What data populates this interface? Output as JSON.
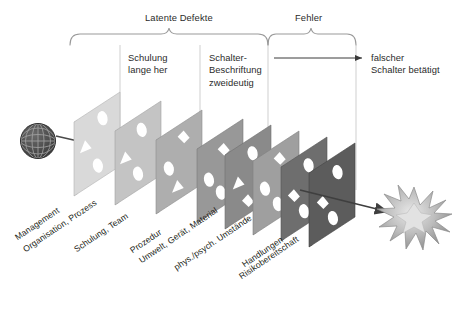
{
  "diagram": {
    "type": "swiss-cheese-model",
    "background_color": "#ffffff",
    "brackets": [
      {
        "label": "Latente Defekte",
        "x_start": 70,
        "x_end": 268,
        "label_x": 145,
        "label_y": 12
      },
      {
        "label": "Fehler",
        "x_start": 268,
        "x_end": 356,
        "label_x": 295,
        "label_y": 12
      }
    ],
    "column_notes": [
      {
        "lines": [
          "Schulung",
          "lange her"
        ],
        "x": 128,
        "y": 52
      },
      {
        "lines": [
          "Schalter-",
          "Beschriftung",
          "zweideutig"
        ],
        "x": 209,
        "y": 52
      },
      {
        "lines": [
          "falscher",
          "Schalter betätigt"
        ],
        "x": 371,
        "y": 52
      }
    ],
    "divider_lines_x": [
      120,
      200,
      268,
      356
    ],
    "hazard_icon": {
      "name": "globe-icon",
      "cx": 38,
      "cy": 141,
      "r": 18
    },
    "outcome_icon": {
      "name": "accident-star-icon",
      "cx": 414,
      "cy": 219,
      "r": 30
    },
    "trajectory_arrow": {
      "from_x": 56,
      "from_y": 136,
      "to_x": 388,
      "to_y": 212
    },
    "straight_arrow": {
      "from_x": 275,
      "from_y": 58,
      "to_x": 363,
      "to_y": 58
    },
    "slices": [
      {
        "label": "Management",
        "fill": "#d9d9d9",
        "edge": "#b4b4b4",
        "x": 74,
        "y": 122
      },
      {
        "label": "Organisation, Prozess",
        "fill": "#c4c4c4",
        "edge": "#a2a2a2",
        "x": 115,
        "y": 131
      },
      {
        "label": "Schulung, Team",
        "fill": "#aeaeae",
        "edge": "#8e8e8e",
        "x": 156,
        "y": 140
      },
      {
        "label": "Prozedur",
        "fill": "#989898",
        "edge": "#7b7b7b",
        "x": 197,
        "y": 149
      },
      {
        "label": "Umwelt, Gerät, Material",
        "fill": "#8a8a8a",
        "edge": "#6e6e6e",
        "x": 225,
        "y": 155
      },
      {
        "label": "phys./psych. Umstände",
        "fill": "#9f9f9f",
        "edge": "#828282",
        "x": 253,
        "y": 161
      },
      {
        "label": "Handlungen",
        "fill": "#6e6e6e",
        "edge": "#565656",
        "x": 281,
        "y": 167
      },
      {
        "label": "Risikobereitschaft",
        "fill": "#5c5c5c",
        "edge": "#454545",
        "x": 309,
        "y": 173
      }
    ],
    "slice_labels": [
      {
        "text": "Management",
        "x": 16,
        "y": 233
      },
      {
        "text": "Organisation, Prozess",
        "x": 24,
        "y": 245
      },
      {
        "text": "Schulung, Team",
        "x": 75,
        "y": 245
      },
      {
        "text": "Prozedur",
        "x": 131,
        "y": 246
      },
      {
        "text": "Umwelt, Gerät, Material",
        "x": 140,
        "y": 256
      },
      {
        "text": "phys./psych. Umstände",
        "x": 175,
        "y": 263
      },
      {
        "text": "Handlungen",
        "x": 243,
        "y": 260
      },
      {
        "text": "Risikobereitschaft",
        "x": 240,
        "y": 272
      }
    ]
  }
}
